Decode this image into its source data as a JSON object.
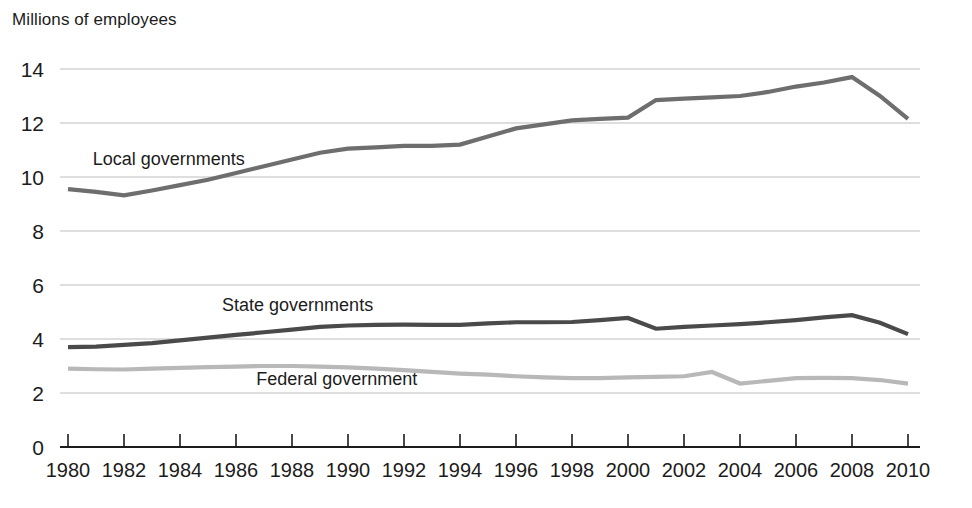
{
  "chart_data": {
    "type": "line",
    "title": "Millions of employees",
    "xlabel": "",
    "ylabel": "Millions of employees",
    "grid": true,
    "legend_position": "inline-annotations",
    "xlim": [
      1980,
      2010
    ],
    "ylim": [
      0,
      14
    ],
    "y_ticks": [
      "0",
      "2",
      "4",
      "6",
      "8",
      "10",
      "12",
      "14"
    ],
    "y_tick_values": [
      0,
      2,
      4,
      6,
      8,
      10,
      12,
      14
    ],
    "x_ticks": [
      "1980",
      "1982",
      "1984",
      "1986",
      "1988",
      "1990",
      "1992",
      "1994",
      "1996",
      "1998",
      "2000",
      "2002",
      "2004",
      "2006",
      "2008",
      "2010"
    ],
    "x_tick_values": [
      1980,
      1982,
      1984,
      1986,
      1988,
      1990,
      1992,
      1994,
      1996,
      1998,
      2000,
      2002,
      2004,
      2006,
      2008,
      2010
    ],
    "x": [
      1980,
      1981,
      1982,
      1983,
      1984,
      1985,
      1986,
      1987,
      1988,
      1989,
      1990,
      1991,
      1992,
      1993,
      1994,
      1995,
      1996,
      1997,
      1998,
      1999,
      2000,
      2001,
      2002,
      2003,
      2004,
      2005,
      2006,
      2007,
      2008,
      2009,
      2010
    ],
    "series": [
      {
        "name": "Local governments",
        "color": "#6e6e6e",
        "label_text": "Local governments",
        "values": [
          9.55,
          9.45,
          9.32,
          9.5,
          9.7,
          9.9,
          10.15,
          10.4,
          10.65,
          10.9,
          11.05,
          11.1,
          11.15,
          11.15,
          11.2,
          11.5,
          11.8,
          11.95,
          12.1,
          12.15,
          12.2,
          12.85,
          12.9,
          12.95,
          13.0,
          13.15,
          13.35,
          13.5,
          13.7,
          13.0,
          12.15
        ]
      },
      {
        "name": "State governments",
        "color": "#4a4a4a",
        "label_text": "State governments",
        "values": [
          3.7,
          3.72,
          3.78,
          3.85,
          3.95,
          4.05,
          4.15,
          4.25,
          4.35,
          4.45,
          4.5,
          4.52,
          4.53,
          4.52,
          4.52,
          4.58,
          4.62,
          4.62,
          4.63,
          4.7,
          4.78,
          4.38,
          4.45,
          4.5,
          4.55,
          4.62,
          4.7,
          4.8,
          4.88,
          4.6,
          4.18
        ]
      },
      {
        "name": "Federal government",
        "color": "#b8b8b8",
        "label_text": "Federal government",
        "values": [
          2.9,
          2.88,
          2.87,
          2.9,
          2.93,
          2.96,
          2.98,
          3.0,
          3.0,
          2.98,
          2.95,
          2.9,
          2.85,
          2.78,
          2.72,
          2.68,
          2.62,
          2.58,
          2.55,
          2.55,
          2.58,
          2.6,
          2.62,
          2.78,
          2.35,
          2.45,
          2.55,
          2.56,
          2.55,
          2.48,
          2.35
        ]
      }
    ],
    "annotations": [
      {
        "text": "Local governments",
        "x": 1983.6,
        "y": 10.45
      },
      {
        "text": "State governments",
        "x": 1988.2,
        "y": 5.05
      },
      {
        "text": "Federal government",
        "x": 1989.6,
        "y": 2.3
      }
    ]
  }
}
